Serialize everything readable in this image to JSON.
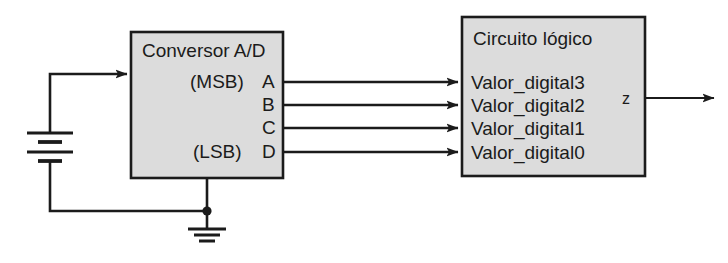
{
  "diagram": {
    "colors": {
      "block_fill": "#dcdcdc",
      "block_stroke": "#1b1b1b",
      "wire": "#1b1b1b",
      "background": "#ffffff",
      "text": "#1b1b1b"
    },
    "blocks": [
      {
        "id": "adc",
        "title": "Conversor A/D",
        "ports": [
          {
            "label": "A",
            "qualifier": "(MSB)"
          },
          {
            "label": "B",
            "qualifier": ""
          },
          {
            "label": "C",
            "qualifier": ""
          },
          {
            "label": "D",
            "qualifier": "(LSB)"
          }
        ]
      },
      {
        "id": "logic",
        "title": "Circuito lógico",
        "inputs": [
          {
            "label": "Valor_digital3"
          },
          {
            "label": "Valor_digital2"
          },
          {
            "label": "Valor_digital1"
          },
          {
            "label": "Valor_digital0"
          }
        ],
        "outputs": [
          {
            "label": "z"
          }
        ]
      }
    ],
    "symbols": [
      {
        "name": "battery-symbol",
        "label": ""
      },
      {
        "name": "ground-symbol",
        "label": ""
      },
      {
        "name": "junction-dot",
        "label": ""
      }
    ],
    "connections": [
      {
        "from": "battery",
        "to": "adc-input",
        "name": "analog-input-wire"
      },
      {
        "from": "adc.A",
        "to": "logic.Valor_digital3",
        "name": "bus-wire-3"
      },
      {
        "from": "adc.B",
        "to": "logic.Valor_digital2",
        "name": "bus-wire-2"
      },
      {
        "from": "adc.C",
        "to": "logic.Valor_digital1",
        "name": "bus-wire-1"
      },
      {
        "from": "adc.D",
        "to": "logic.Valor_digital0",
        "name": "bus-wire-0"
      },
      {
        "from": "logic.z",
        "to": "output",
        "name": "output-wire"
      },
      {
        "from": "adc.gnd",
        "to": "ground",
        "name": "ground-wire"
      }
    ]
  }
}
